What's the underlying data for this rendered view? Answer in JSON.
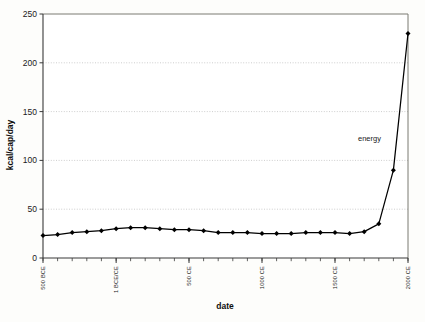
{
  "chart_data": {
    "type": "line",
    "title": "",
    "xlabel": "date",
    "ylabel": "kcal/cap/day",
    "ylim": [
      0,
      250
    ],
    "yticks": [
      0,
      50,
      100,
      150,
      200,
      250
    ],
    "ytick_labels": [
      "0",
      "50",
      "100",
      "150",
      "200",
      "250"
    ],
    "grid": "horizontal-dotted",
    "legend_position": "inline-annotation",
    "xlim": [
      -500,
      2000
    ],
    "xtick_labels": [
      "500 BCE",
      "1 BCE/CE",
      "500 CE",
      "1000 CE",
      "1500 CE",
      "2000 CE"
    ],
    "xtick_values": [
      -500,
      1,
      500,
      1000,
      1500,
      2000
    ],
    "series": [
      {
        "name": "energy",
        "annotation": "energy",
        "marker": "diamond",
        "color": "#000000",
        "x": [
          -500,
          -400,
          -300,
          -200,
          -100,
          1,
          100,
          200,
          300,
          400,
          500,
          600,
          700,
          800,
          900,
          1000,
          1100,
          1200,
          1300,
          1400,
          1500,
          1600,
          1700,
          1800,
          1900,
          2000
        ],
        "values": [
          23,
          24,
          26,
          27,
          28,
          30,
          31,
          31,
          30,
          29,
          29,
          28,
          26,
          26,
          26,
          25,
          25,
          25,
          26,
          26,
          26,
          25,
          27,
          35,
          90,
          230
        ]
      }
    ]
  },
  "axes": {
    "x_title": "date",
    "y_title": "kcal/cap/day"
  },
  "annotations": {
    "energy_label": "energy"
  }
}
